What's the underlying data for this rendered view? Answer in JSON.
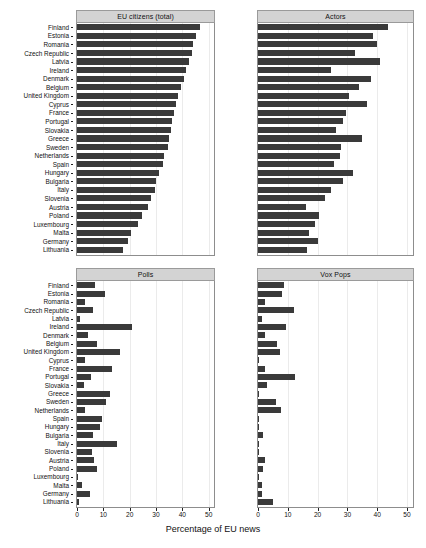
{
  "chart_data": {
    "type": "bar",
    "title": "",
    "xlabel": "Percentage of EU news",
    "ylabel": "",
    "xlim": [
      0,
      52
    ],
    "xticks": [
      0,
      10,
      20,
      30,
      40,
      50
    ],
    "orientation": "horizontal",
    "grid": true,
    "legend": "none",
    "layout": "2x2 facet panels, shared country axis, shared x axis",
    "categories": [
      "Finland",
      "Estonia",
      "Romania",
      "Czech Republic",
      "Latvia",
      "Ireland",
      "Denmark",
      "Belgium",
      "United Kingdom",
      "Cyprus",
      "France",
      "Portugal",
      "Slovakia",
      "Greece",
      "Sweden",
      "Netherlands",
      "Spain",
      "Hungary",
      "Bulgaria",
      "Italy",
      "Slovenia",
      "Austria",
      "Poland",
      "Luxembourg",
      "Malta",
      "Germany",
      "Lithuania"
    ],
    "panels": [
      {
        "name": "eu-citizens-total",
        "title": "EU citizens (total)",
        "values": [
          46.5,
          45.0,
          44.0,
          43.5,
          42.5,
          41.5,
          40.5,
          39.5,
          38.5,
          37.5,
          36.8,
          36.0,
          35.5,
          35.0,
          34.5,
          33.0,
          32.5,
          31.0,
          30.0,
          29.5,
          28.0,
          27.0,
          24.5,
          23.0,
          20.5,
          19.5,
          17.5
        ]
      },
      {
        "name": "actors",
        "title": "Actors",
        "values": [
          43.5,
          38.5,
          40.0,
          32.5,
          41.0,
          24.5,
          38.0,
          34.0,
          30.5,
          36.5,
          29.5,
          28.5,
          26.0,
          35.0,
          28.0,
          27.5,
          25.5,
          32.0,
          28.5,
          24.5,
          22.5,
          16.0,
          20.5,
          19.0,
          17.0,
          20.0,
          16.5
        ]
      },
      {
        "name": "polls",
        "title": "Polls",
        "values": [
          6.8,
          10.8,
          3.0,
          6.0,
          1.2,
          20.8,
          4.2,
          7.5,
          16.5,
          3.0,
          13.2,
          5.5,
          2.5,
          12.5,
          11.0,
          3.0,
          9.5,
          8.8,
          6.2,
          15.0,
          5.8,
          6.5,
          7.5,
          0.2,
          1.8,
          4.8,
          0.6
        ]
      },
      {
        "name": "vox-pops",
        "title": "Vox Pops",
        "values": [
          8.8,
          8.2,
          2.5,
          12.0,
          1.2,
          9.5,
          2.2,
          6.5,
          7.5,
          0.3,
          2.2,
          12.5,
          3.0,
          0.4,
          6.0,
          7.8,
          0.5,
          0.4,
          1.8,
          0.3,
          0.5,
          2.2,
          1.6,
          0.2,
          1.2,
          1.3,
          5.0
        ]
      }
    ]
  }
}
